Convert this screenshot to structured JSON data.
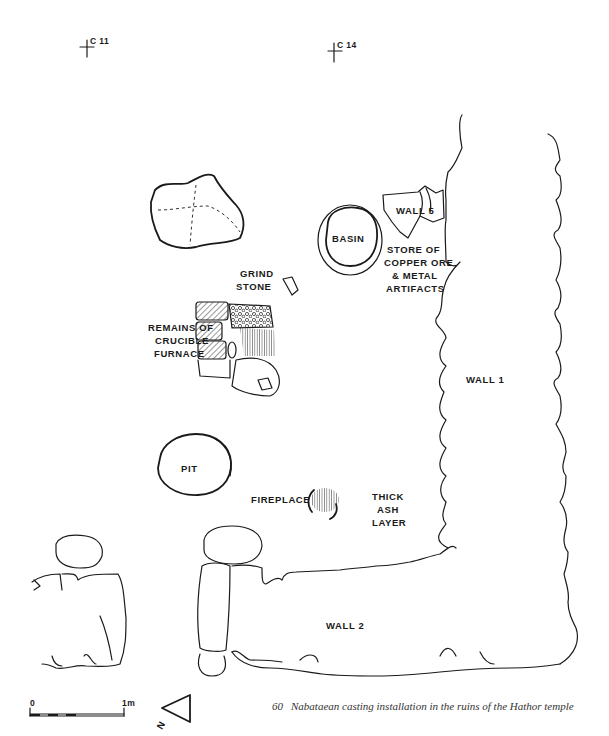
{
  "grid_markers": [
    {
      "id": "C 11",
      "x": 98,
      "y": 48
    },
    {
      "id": "C 14",
      "x": 388,
      "y": 52
    }
  ],
  "labels": {
    "basin": "BASIN",
    "wall5": "WALL 5",
    "store": [
      "STORE OF",
      "COPPER ORE",
      "& METAL",
      "ARTIFACTS"
    ],
    "grind_stone": [
      "GRIND",
      "STONE"
    ],
    "furnace": [
      "REMAINS OF",
      "CRUCIBLE",
      "FURNACE"
    ],
    "wall1": "WALL 1",
    "pit": "PIT",
    "fireplace": "FIREPLACE",
    "ash": [
      "THICK",
      "ASH",
      "LAYER"
    ],
    "wall2": "WALL 2"
  },
  "scale_bar": {
    "start": "0",
    "end": "1m"
  },
  "north_arrow": {
    "letter": "N"
  },
  "caption": {
    "number": "60",
    "text": "Nabataean casting installation in the ruins of the Hathor temple"
  }
}
